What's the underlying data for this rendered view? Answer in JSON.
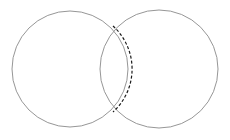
{
  "figure": {
    "background_color": "#ffffff",
    "width": 230,
    "height": 140
  },
  "chart_data": {
    "type": "diagram",
    "subtype": "venn-two-set",
    "title": "",
    "xlabel": "",
    "ylabel": "",
    "grid": false,
    "legend": null,
    "annotations": [],
    "shapes": [
      {
        "name": "left-circle",
        "kind": "circle",
        "cx": 70,
        "cy": 69,
        "r": 58,
        "stroke": "#8a8a8a",
        "stroke_width": 0.9,
        "dash": "none",
        "fill": "none"
      },
      {
        "name": "right-circle",
        "kind": "circle",
        "cx": 159,
        "cy": 69,
        "r": 59,
        "stroke": "#8a8a8a",
        "stroke_width": 0.9,
        "dash": "none",
        "fill": "none"
      },
      {
        "name": "intersection-arc",
        "kind": "arc",
        "belongs_to": "left-circle",
        "cx": 70,
        "cy": 69,
        "r": 58,
        "start_point": [
          113,
          26
        ],
        "end_point": [
          113,
          112
        ],
        "sweep": "right",
        "stroke": "#1a1a1a",
        "stroke_width": 1.2,
        "dash": "3 2",
        "fill": "none"
      }
    ],
    "intersection_points": [
      {
        "name": "upper-intersection",
        "x": 113,
        "y": 26
      },
      {
        "name": "lower-intersection",
        "x": 113,
        "y": 112
      }
    ]
  }
}
